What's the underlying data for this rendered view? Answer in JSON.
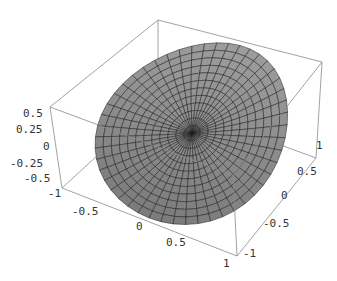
{
  "chart_data": {
    "type": "surface3d",
    "title": "",
    "xlabel": "",
    "ylabel": "",
    "zlabel": "",
    "x_ticks": [
      "-1",
      "-0.5",
      "0",
      "0.5",
      "1"
    ],
    "y_ticks": [
      "-1",
      "-0.5",
      "0",
      "0.5",
      "1"
    ],
    "z_ticks": [
      "-0.5",
      "-0.25",
      "0",
      "0.25",
      "0.5"
    ],
    "xlim": [
      -1,
      1
    ],
    "ylim": [
      -1,
      1
    ],
    "zlim": [
      -0.5,
      0.5
    ],
    "surface_color": "#9a9a9a",
    "mesh_color": "#1a1a1a",
    "box_color": "#888888",
    "grid": false,
    "legend": null
  },
  "axes": {
    "z_labels": [
      {
        "text": "0.5",
        "x": 23,
        "y": 108
      },
      {
        "text": "0.25",
        "x": 16,
        "y": 124
      },
      {
        "text": "0",
        "x": 43,
        "y": 141
      },
      {
        "text": "-0.25",
        "x": 10,
        "y": 158
      },
      {
        "text": "-0.5",
        "x": 24,
        "y": 173
      }
    ],
    "x_labels": [
      {
        "text": "-1",
        "x": 48,
        "y": 188
      },
      {
        "text": "-0.5",
        "x": 72,
        "y": 206
      },
      {
        "text": "0",
        "x": 136,
        "y": 221
      },
      {
        "text": "0.5",
        "x": 166,
        "y": 237
      },
      {
        "text": "1",
        "x": 223,
        "y": 258
      }
    ],
    "y_labels": [
      {
        "text": "1",
        "x": 316,
        "y": 140
      },
      {
        "text": "0.5",
        "x": 297,
        "y": 166
      },
      {
        "text": "0",
        "x": 281,
        "y": 190
      },
      {
        "text": "-0.5",
        "x": 263,
        "y": 218
      },
      {
        "text": "-1",
        "x": 243,
        "y": 248
      }
    ]
  }
}
